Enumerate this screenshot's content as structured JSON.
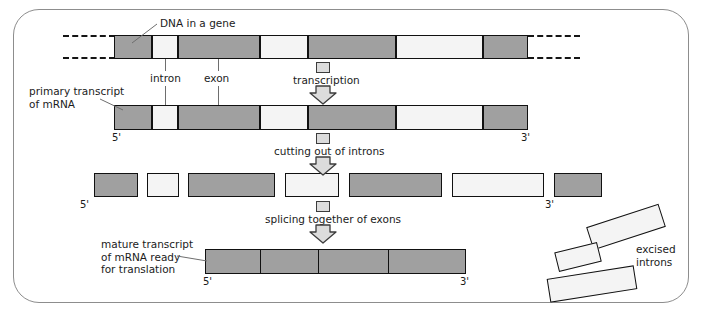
{
  "figure": {
    "colors": {
      "exon_fill": "#a0a0a0",
      "intron_fill": "#f4f4f4",
      "outline": "#111111",
      "frame": "#8d8d8d",
      "text": "#1b1b1b",
      "leader": "#6e6e6e",
      "arrow_fill": "#dcdcdc",
      "arrow_stroke": "#3c3c3c"
    }
  },
  "labels": {
    "dna_in_a_gene": "DNA in a gene",
    "intron": "intron",
    "exon": "exon",
    "primary_transcript": "primary transcript\nof mRNA",
    "mature_transcript": "mature transcript\nof mRNA ready\nfor translation",
    "excised_introns": "excised\nintrons",
    "five_prime": "5'",
    "three_prime": "3'"
  },
  "steps": [
    {
      "id": "transcription",
      "label": "transcription"
    },
    {
      "id": "cutting-out-of-introns",
      "label": "cutting out of introns"
    },
    {
      "id": "splicing-together-of-exons",
      "label": "splicing together of exons"
    }
  ],
  "rows": {
    "dna": {
      "name": "DNA in a gene",
      "y": 35,
      "height": 24,
      "segments": [
        {
          "type": "exon",
          "x": 114,
          "w": 38
        },
        {
          "type": "intron",
          "x": 152,
          "w": 26
        },
        {
          "type": "exon",
          "x": 178,
          "w": 82
        },
        {
          "type": "intron",
          "x": 260,
          "w": 48
        },
        {
          "type": "exon",
          "x": 308,
          "w": 88
        },
        {
          "type": "intron",
          "x": 396,
          "w": 87
        },
        {
          "type": "exon",
          "x": 483,
          "w": 45
        }
      ],
      "dashes": [
        {
          "x": 63,
          "w": 52,
          "y": 35
        },
        {
          "x": 63,
          "w": 52,
          "y": 57
        },
        {
          "x": 528,
          "w": 52,
          "y": 35
        },
        {
          "x": 528,
          "w": 52,
          "y": 57
        }
      ]
    },
    "primary_transcript": {
      "name": "primary transcript of mRNA",
      "y": 105,
      "height": 25,
      "segments": [
        {
          "type": "exon",
          "x": 114,
          "w": 38
        },
        {
          "type": "intron",
          "x": 152,
          "w": 26
        },
        {
          "type": "exon",
          "x": 178,
          "w": 82
        },
        {
          "type": "intron",
          "x": 260,
          "w": 48
        },
        {
          "type": "exon",
          "x": 308,
          "w": 88
        },
        {
          "type": "intron",
          "x": 396,
          "w": 87
        },
        {
          "type": "exon",
          "x": 483,
          "w": 45
        }
      ],
      "five_prime_x": 112,
      "three_prime_x": 521
    },
    "cut_fragments": {
      "name": "fragments after cutting out of introns",
      "y": 173,
      "height": 24,
      "segments": [
        {
          "type": "exon",
          "x": 94,
          "w": 44
        },
        {
          "type": "intron",
          "x": 147,
          "w": 32
        },
        {
          "type": "exon",
          "x": 188,
          "w": 87
        },
        {
          "type": "intron",
          "x": 285,
          "w": 54
        },
        {
          "type": "exon",
          "x": 349,
          "w": 93
        },
        {
          "type": "intron",
          "x": 452,
          "w": 92
        },
        {
          "type": "exon",
          "x": 554,
          "w": 48
        }
      ],
      "five_prime_x": 80,
      "three_prime_x": 545
    },
    "mature_transcript": {
      "name": "mature transcript of mRNA ready for translation",
      "y": 249,
      "height": 25,
      "x": 205,
      "w": 261,
      "dividers": [
        260,
        318,
        388
      ],
      "five_prime_x": 203,
      "three_prime_x": 460
    }
  },
  "excised_introns": [
    {
      "x": 588,
      "y": 215,
      "w": 76,
      "h": 24,
      "rotate": -18
    },
    {
      "x": 556,
      "y": 247,
      "w": 44,
      "h": 20,
      "rotate": -14
    },
    {
      "x": 548,
      "y": 272,
      "w": 88,
      "h": 24,
      "rotate": -9
    }
  ]
}
